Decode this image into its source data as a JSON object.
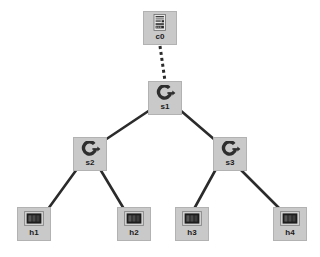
{
  "diagram": {
    "type": "tree",
    "background_color": "#ffffff",
    "node_fill_color": "#c9c9c9",
    "node_border_color": "#b2b2b2",
    "label_color": "#1a1a1a",
    "link_color": "#2b2b2b"
  },
  "nodes": [
    {
      "id": "c0",
      "label": "c0",
      "role": "controller",
      "icon": "controller-icon",
      "x": 143,
      "y": 11
    },
    {
      "id": "s1",
      "label": "s1",
      "role": "switch",
      "icon": "switch-icon",
      "x": 148,
      "y": 81
    },
    {
      "id": "s2",
      "label": "s2",
      "role": "switch",
      "icon": "switch-icon",
      "x": 73,
      "y": 137
    },
    {
      "id": "s3",
      "label": "s3",
      "role": "switch",
      "icon": "switch-icon",
      "x": 213,
      "y": 137
    },
    {
      "id": "h1",
      "label": "h1",
      "role": "host",
      "icon": "host-icon",
      "x": 17,
      "y": 207
    },
    {
      "id": "h2",
      "label": "h2",
      "role": "host",
      "icon": "host-icon",
      "x": 117,
      "y": 207
    },
    {
      "id": "h3",
      "label": "h3",
      "role": "host",
      "icon": "host-icon",
      "x": 175,
      "y": 207
    },
    {
      "id": "h4",
      "label": "h4",
      "role": "host",
      "icon": "host-icon",
      "x": 273,
      "y": 207
    }
  ],
  "links": [
    {
      "from": "c0",
      "to": "s1",
      "style": "dashed",
      "x1": 160,
      "y1": 46,
      "x2": 165,
      "y2": 81
    },
    {
      "from": "s1",
      "to": "s2",
      "style": "solid",
      "x1": 150,
      "y1": 110,
      "x2": 105,
      "y2": 140
    },
    {
      "from": "s1",
      "to": "s3",
      "style": "solid",
      "x1": 180,
      "y1": 110,
      "x2": 215,
      "y2": 140
    },
    {
      "from": "s2",
      "to": "h1",
      "style": "solid",
      "x1": 77,
      "y1": 169,
      "x2": 48,
      "y2": 209
    },
    {
      "from": "s2",
      "to": "h2",
      "style": "solid",
      "x1": 100,
      "y1": 169,
      "x2": 124,
      "y2": 209
    },
    {
      "from": "s3",
      "to": "h3",
      "style": "solid",
      "x1": 216,
      "y1": 169,
      "x2": 194,
      "y2": 209
    },
    {
      "from": "s3",
      "to": "h4",
      "style": "solid",
      "x1": 240,
      "y1": 169,
      "x2": 280,
      "y2": 209
    }
  ]
}
